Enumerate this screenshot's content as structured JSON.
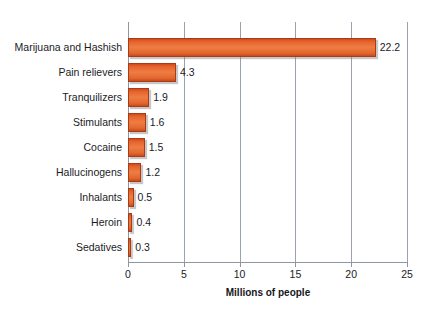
{
  "chart_data": {
    "type": "bar",
    "orientation": "horizontal",
    "title": "",
    "xlabel": "Millions of people",
    "ylabel": "",
    "xlim": [
      0,
      25
    ],
    "xticks": [
      0,
      5,
      10,
      15,
      20,
      25
    ],
    "xtick_labels": [
      "0",
      "5",
      "10",
      "15",
      "20",
      "25"
    ],
    "grid": "vertical",
    "legend": "none",
    "categories": [
      "Marijuana and Hashish",
      "Pain relievers",
      "Tranquilizers",
      "Stimulants",
      "Cocaine",
      "Hallucinogens",
      "Inhalants",
      "Heroin",
      "Sedatives"
    ],
    "values": [
      22.2,
      4.3,
      1.9,
      1.6,
      1.5,
      1.2,
      0.5,
      0.4,
      0.3
    ],
    "value_labels": [
      "22.2",
      "4.3",
      "1.9",
      "1.6",
      "1.5",
      "1.2",
      "0.5",
      "0.4",
      "0.3"
    ],
    "colors": {
      "bar_fill_light": "#ef7d43",
      "bar_fill_dark": "#c94a1c",
      "bar_border": "#a83c15",
      "grid": "#9aa3ad",
      "axis": "#8e96a0",
      "text": "#1b1b1f",
      "background": "#ffffff"
    }
  }
}
